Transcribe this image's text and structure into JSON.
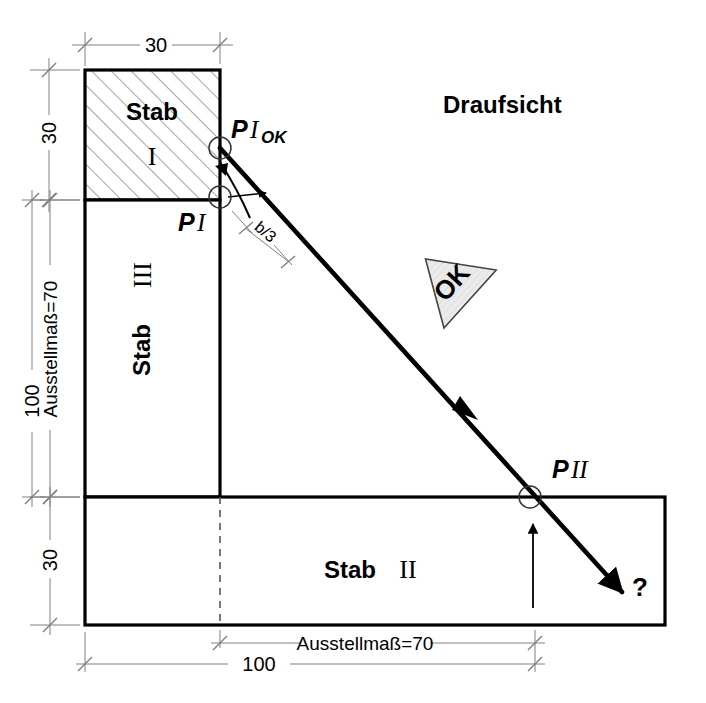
{
  "title": "Draufsicht",
  "labels": {
    "stab_1_name": "Stab",
    "stab_1_num": "I",
    "stab_2_name": "Stab",
    "stab_2_num": "II",
    "stab_3_name": "Stab",
    "stab_3_num": "III",
    "point_1_p": "P",
    "point_1_i": "I",
    "point_1_ok_p": "P",
    "point_1_ok_i": "I",
    "point_1_ok_sub": "OK",
    "point_2_p": "P",
    "point_2_i": "II",
    "question_mark": "?",
    "ok_flag": "OK",
    "b_over_3": "b/3"
  },
  "dimensions": {
    "top_width": "30",
    "left_upper_height": "30",
    "left_total_height": "100",
    "left_ausstellmass": "Ausstellmaß=70",
    "left_lower_height": "30",
    "bottom_total_width": "100",
    "bottom_ausstellmass": "Ausstellmaß=70"
  },
  "colors": {
    "outline": "#000000",
    "hatch": "#000000",
    "dimension_line": "#808080",
    "thick_arrow": "#000000",
    "flag_fill": "#e8e8e8",
    "background": "#ffffff"
  },
  "geometry": {
    "stab1": {
      "x": 85,
      "y": 70,
      "w": 135,
      "h": 130
    },
    "stab3": {
      "x": 85,
      "y": 200,
      "w": 135,
      "h": 297
    },
    "stab2": {
      "x": 85,
      "y": 497,
      "w": 580,
      "h": 128
    },
    "force_line": {
      "x1": 220,
      "y1": 148,
      "x2": 622,
      "y2": 592
    },
    "point_1_ok": {
      "cx": 220,
      "cy": 148,
      "r": 11
    },
    "point_1": {
      "cx": 220,
      "cy": 197,
      "r": 11
    },
    "point_2": {
      "cx": 530,
      "cy": 497,
      "r": 11
    }
  }
}
